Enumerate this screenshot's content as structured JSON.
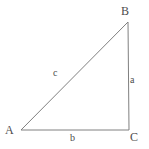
{
  "figure": {
    "type": "right-triangle-diagram",
    "background_color": "#ffffff",
    "stroke_color": "#808080",
    "label_color": "#4c4c4c",
    "vertices": [
      {
        "id": "A",
        "label": "A",
        "x": 21,
        "y": 130
      },
      {
        "id": "B",
        "label": "B",
        "x": 128,
        "y": 22
      },
      {
        "id": "C",
        "label": "C",
        "x": 129,
        "y": 130
      }
    ],
    "sides": [
      {
        "id": "a",
        "label": "a",
        "from": "B",
        "to": "C",
        "description": "vertical-right-side"
      },
      {
        "id": "b",
        "label": "b",
        "from": "A",
        "to": "C",
        "description": "horizontal-base"
      },
      {
        "id": "c",
        "label": "c",
        "from": "A",
        "to": "B",
        "description": "hypotenuse"
      }
    ],
    "geometry": {
      "path": "M 21 130 L 128 22 L 129 130 Z",
      "stroke_width": 1
    }
  }
}
